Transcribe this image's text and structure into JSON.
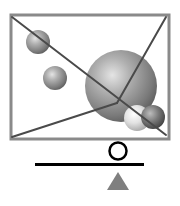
{
  "diagram": {
    "frame": {
      "x": 11,
      "y": 15,
      "width": 158,
      "height": 124,
      "stroke": "#8a8a8a",
      "stroke_width": 3
    },
    "lines": [
      {
        "x1": 12,
        "y1": 17,
        "x2": 166,
        "y2": 135,
        "color": "#4a4a4a"
      },
      {
        "x1": 166,
        "y1": 17,
        "x2": 117,
        "y2": 103,
        "color": "#4a4a4a"
      },
      {
        "x1": 117,
        "y1": 103,
        "x2": 12,
        "y2": 137,
        "color": "#4a4a4a"
      }
    ],
    "spheres": [
      {
        "name": "small-top-left",
        "cx": 38,
        "cy": 42,
        "r": 12,
        "tone": "mid"
      },
      {
        "name": "small-left",
        "cx": 55,
        "cy": 78,
        "r": 12,
        "tone": "mid"
      },
      {
        "name": "large-center",
        "cx": 121,
        "cy": 86,
        "r": 36,
        "tone": "mid"
      },
      {
        "name": "light-bottom",
        "cx": 137,
        "cy": 118,
        "r": 13,
        "tone": "light"
      },
      {
        "name": "dark-bottom",
        "cx": 153,
        "cy": 117,
        "r": 12,
        "tone": "dark"
      }
    ],
    "balance": {
      "beam": {
        "x1": 35,
        "y1": 164.5,
        "x2": 144,
        "y2": 164.5,
        "color": "#000000",
        "stroke_width": 3
      },
      "weight_circle": {
        "cx": 118,
        "cy": 151,
        "r": 8.5,
        "color": "#000000",
        "stroke_width": 2.5
      },
      "fulcrum": {
        "points": "118,172 107,190 129,190",
        "color": "#7f7f7f"
      }
    }
  }
}
